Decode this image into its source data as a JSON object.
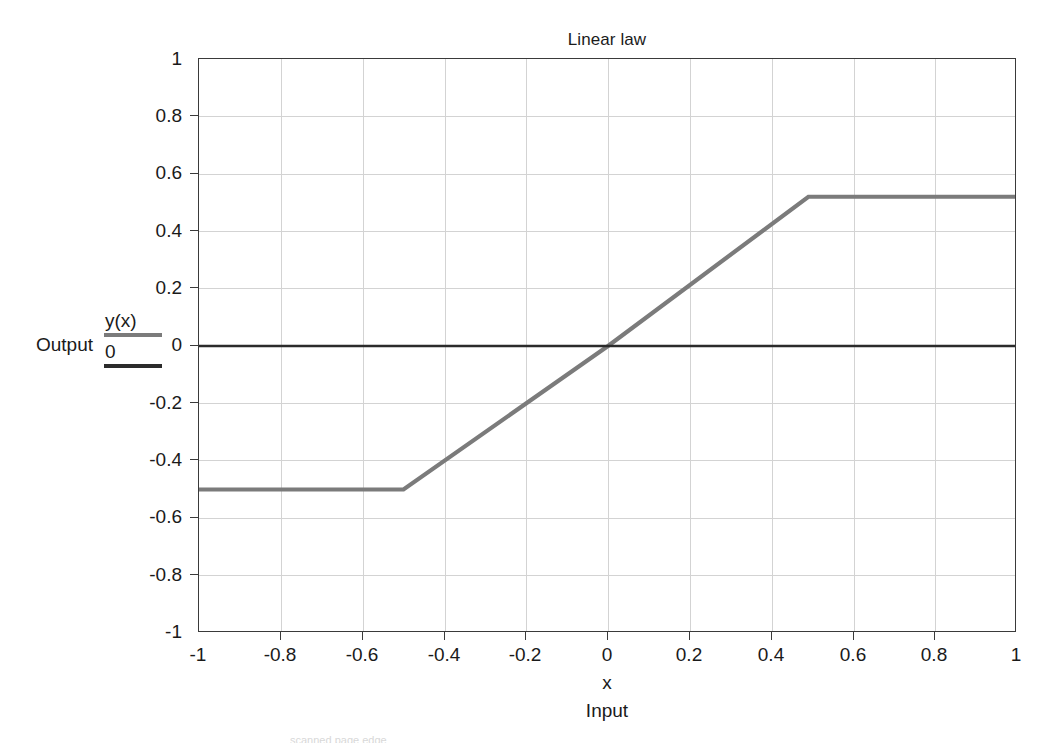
{
  "chart_data": {
    "type": "line",
    "title": "Linear law",
    "xlabel": "x",
    "ylabel": "",
    "xlim": [
      -1,
      1
    ],
    "ylim": [
      -1,
      1
    ],
    "grid": true,
    "legend_position": "left-outside",
    "x_ticks": [
      "-1",
      "-0.8",
      "-0.6",
      "-0.4",
      "-0.2",
      "0",
      "0.2",
      "0.4",
      "0.6",
      "0.8",
      "1"
    ],
    "x_tick_values": [
      -1,
      -0.8,
      -0.6,
      -0.4,
      -0.2,
      0,
      0.2,
      0.4,
      0.6,
      0.8,
      1
    ],
    "y_ticks": [
      "1",
      "0.8",
      "0.6",
      "0.4",
      "0.2",
      "0",
      "-0.2",
      "-0.4",
      "-0.6",
      "-0.8",
      "-1"
    ],
    "y_tick_values": [
      1,
      0.8,
      0.6,
      0.4,
      0.2,
      0,
      -0.2,
      -0.4,
      -0.6,
      -0.8,
      -1
    ],
    "series": [
      {
        "name": "y(x)",
        "color": "#7b7b7b",
        "x": [
          -1,
          -0.5,
          0,
          0.49,
          1
        ],
        "values": [
          -0.5,
          -0.5,
          0.0,
          0.52,
          0.52
        ]
      },
      {
        "name": "0",
        "color": "#2b2b2b",
        "x": [
          -1,
          1
        ],
        "values": [
          0,
          0
        ]
      }
    ],
    "annotations": {
      "output_axis_label": "Output",
      "input_axis_label": "Input",
      "x_axis_symbol": "x"
    }
  },
  "legend": {
    "items": [
      {
        "label": "y(x)",
        "color": "#7b7b7b"
      },
      {
        "label": "0",
        "color": "#2b2b2b"
      }
    ]
  },
  "labels": {
    "output": "Output",
    "input": "Input",
    "x_symbol": "x",
    "title": "Linear law"
  },
  "artifact": {
    "bottom_text": "scanned page edge"
  }
}
